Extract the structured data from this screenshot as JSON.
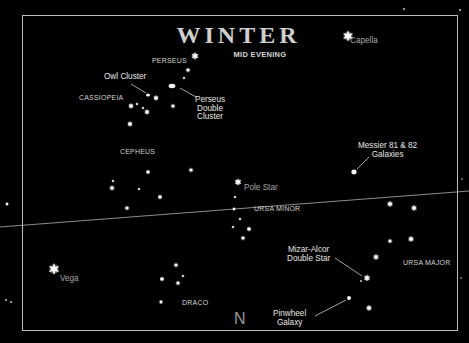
{
  "chart": {
    "title": "Winter",
    "subtitle": "MID EVENING",
    "compass": "N",
    "colors": {
      "background": "#000000",
      "frame": "#bdbdbd",
      "star": "#ffffff",
      "text": "#d9d9d9",
      "dim_text": "#a8a8a8",
      "horizon": "#b0b0b0"
    },
    "horizon_line": {
      "x1": 0,
      "y1": 227,
      "x2": 469,
      "y2": 191
    },
    "constellations": [
      {
        "name": "PERSEUS",
        "x": 152,
        "y": 57
      },
      {
        "name": "CASSIOPEIA",
        "x": 79,
        "y": 94
      },
      {
        "name": "CEPHEUS",
        "x": 120,
        "y": 148
      },
      {
        "name": "URSA MINOR",
        "x": 254,
        "y": 205
      },
      {
        "name": "URSA MAJOR",
        "x": 403,
        "y": 259
      },
      {
        "name": "DRACO",
        "x": 182,
        "y": 299
      }
    ],
    "bright_stars": [
      {
        "name": "Capella",
        "x": 348,
        "y": 36,
        "label_x": 350,
        "label_y": 37
      },
      {
        "name": "Pole Star",
        "x": 238,
        "y": 182,
        "label_x": 244,
        "label_y": 184
      },
      {
        "name": "Vega",
        "x": 54,
        "y": 269,
        "label_x": 60,
        "label_y": 275
      }
    ],
    "deep_sky_objects": [
      {
        "name_lines": [
          "Owl Cluster"
        ],
        "label_x": 104,
        "label_y": 73,
        "obj_x": 148,
        "obj_y": 95,
        "leader": [
          131,
          84,
          146,
          93
        ]
      },
      {
        "name_lines": [
          "Perseus",
          "Double",
          "Cluster"
        ],
        "label_x": 195,
        "label_y": 96,
        "obj_x": 172,
        "obj_y": 86,
        "leader": [
          180,
          88,
          196,
          97
        ]
      },
      {
        "name_lines": [
          "Messier 81 & 82",
          "Galaxies"
        ],
        "label_x": 358,
        "label_y": 142,
        "obj_x": 354,
        "obj_y": 172,
        "leader": [
          357,
          169,
          369,
          157
        ]
      },
      {
        "name_lines": [
          "Mizar-Alcor",
          "Double Star"
        ],
        "label_x": 287,
        "label_y": 246,
        "obj_x": 366,
        "obj_y": 278,
        "leader": [
          335,
          258,
          362,
          276
        ]
      },
      {
        "name_lines": [
          "Pinwheel",
          "Galaxy"
        ],
        "label_x": 273,
        "label_y": 310,
        "obj_x": 349,
        "obj_y": 298,
        "leader": [
          315,
          316,
          346,
          300
        ]
      }
    ],
    "stars": [
      {
        "x": 348,
        "y": 36,
        "r": 4.2,
        "shape": "burst"
      },
      {
        "x": 195,
        "y": 56,
        "r": 3.0,
        "shape": "burst"
      },
      {
        "x": 188,
        "y": 70,
        "r": 1.6,
        "shape": "dot"
      },
      {
        "x": 184,
        "y": 78,
        "r": 1.0,
        "shape": "dot"
      },
      {
        "x": 156,
        "y": 98,
        "r": 2.2,
        "shape": "burst"
      },
      {
        "x": 131,
        "y": 106,
        "r": 2.2,
        "shape": "burst"
      },
      {
        "x": 137,
        "y": 104,
        "r": 1.0,
        "shape": "dot"
      },
      {
        "x": 143,
        "y": 108,
        "r": 1.0,
        "shape": "dot"
      },
      {
        "x": 147,
        "y": 112,
        "r": 2.2,
        "shape": "burst"
      },
      {
        "x": 173,
        "y": 106,
        "r": 1.6,
        "shape": "dot"
      },
      {
        "x": 130,
        "y": 124,
        "r": 2.2,
        "shape": "burst"
      },
      {
        "x": 148,
        "y": 172,
        "r": 1.8,
        "shape": "burst"
      },
      {
        "x": 191,
        "y": 170,
        "r": 1.6,
        "shape": "dot"
      },
      {
        "x": 113,
        "y": 181,
        "r": 1.0,
        "shape": "dot"
      },
      {
        "x": 112,
        "y": 188,
        "r": 1.8,
        "shape": "dot"
      },
      {
        "x": 139,
        "y": 189,
        "r": 1.0,
        "shape": "dot"
      },
      {
        "x": 160,
        "y": 197,
        "r": 2.0,
        "shape": "burst"
      },
      {
        "x": 127,
        "y": 208,
        "r": 1.6,
        "shape": "dot"
      },
      {
        "x": 238,
        "y": 182,
        "r": 2.8,
        "shape": "burst"
      },
      {
        "x": 235,
        "y": 197,
        "r": 1.0,
        "shape": "dot"
      },
      {
        "x": 234,
        "y": 209,
        "r": 1.2,
        "shape": "dot"
      },
      {
        "x": 240,
        "y": 219,
        "r": 1.0,
        "shape": "dot"
      },
      {
        "x": 233,
        "y": 227,
        "r": 1.0,
        "shape": "dot"
      },
      {
        "x": 249,
        "y": 229,
        "r": 2.0,
        "shape": "burst"
      },
      {
        "x": 243,
        "y": 238,
        "r": 1.6,
        "shape": "dot"
      },
      {
        "x": 390,
        "y": 204,
        "r": 2.4,
        "shape": "burst"
      },
      {
        "x": 414,
        "y": 208,
        "r": 2.4,
        "shape": "burst"
      },
      {
        "x": 390,
        "y": 241,
        "r": 1.6,
        "shape": "dot"
      },
      {
        "x": 411,
        "y": 239,
        "r": 2.4,
        "shape": "burst"
      },
      {
        "x": 376,
        "y": 257,
        "r": 2.4,
        "shape": "burst"
      },
      {
        "x": 367,
        "y": 278,
        "r": 2.6,
        "shape": "burst"
      },
      {
        "x": 361,
        "y": 281,
        "r": 0.8,
        "shape": "dot"
      },
      {
        "x": 369,
        "y": 308,
        "r": 2.4,
        "shape": "burst"
      },
      {
        "x": 176,
        "y": 265,
        "r": 1.6,
        "shape": "dot"
      },
      {
        "x": 162,
        "y": 279,
        "r": 2.0,
        "shape": "burst"
      },
      {
        "x": 183,
        "y": 276,
        "r": 1.0,
        "shape": "dot"
      },
      {
        "x": 178,
        "y": 283,
        "r": 1.6,
        "shape": "dot"
      },
      {
        "x": 161,
        "y": 302,
        "r": 1.4,
        "shape": "dot"
      },
      {
        "x": 54,
        "y": 269,
        "r": 4.4,
        "shape": "burst"
      },
      {
        "x": 7,
        "y": 204,
        "r": 1.2,
        "shape": "dot"
      },
      {
        "x": 6,
        "y": 300,
        "r": 0.8,
        "shape": "dot"
      },
      {
        "x": 11,
        "y": 302,
        "r": 0.8,
        "shape": "dot"
      },
      {
        "x": 462,
        "y": 179,
        "r": 0.6,
        "shape": "dot"
      },
      {
        "x": 461,
        "y": 278,
        "r": 0.6,
        "shape": "dot"
      },
      {
        "x": 404,
        "y": 9,
        "r": 0.8,
        "shape": "dot"
      },
      {
        "x": 460,
        "y": 10,
        "r": 0.8,
        "shape": "dot"
      }
    ],
    "objects": [
      {
        "type": "cluster",
        "x": 148,
        "y": 95,
        "rx": 2.0,
        "ry": 1.6
      },
      {
        "type": "double-cluster",
        "x": 172,
        "y": 86,
        "rx": 3.4,
        "ry": 2.2
      },
      {
        "type": "galaxy",
        "x": 354,
        "y": 172,
        "rx": 2.6,
        "ry": 2.4
      },
      {
        "type": "galaxy",
        "x": 349,
        "y": 298,
        "rx": 2.0,
        "ry": 2.0
      }
    ]
  }
}
